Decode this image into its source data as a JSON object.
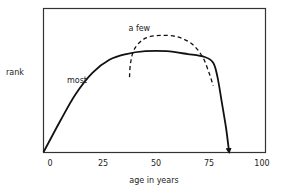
{
  "chart_data": {
    "type": "line",
    "title": "",
    "xlabel": "age in years",
    "ylabel": "rank",
    "xlim": [
      0,
      100
    ],
    "ylim": [
      0,
      1
    ],
    "x_ticks": [
      "0",
      "25",
      "50",
      "75",
      "100"
    ],
    "x_tick_values": [
      0,
      25,
      50,
      75,
      100
    ],
    "grid": false,
    "legend": "none",
    "series": [
      {
        "name": "most",
        "style": "solid",
        "arrow_end": true,
        "points": [
          [
            -3,
            0
          ],
          [
            5,
            0.22
          ],
          [
            12,
            0.4
          ],
          [
            20,
            0.55
          ],
          [
            28,
            0.64
          ],
          [
            36,
            0.68
          ],
          [
            45,
            0.7
          ],
          [
            55,
            0.7
          ],
          [
            65,
            0.68
          ],
          [
            73,
            0.66
          ],
          [
            77,
            0.62
          ],
          [
            79,
            0.52
          ],
          [
            81,
            0.35
          ],
          [
            83,
            0.17
          ],
          [
            84.5,
            0
          ]
        ]
      },
      {
        "name": "a few",
        "style": "dashed",
        "arrow_end": false,
        "points": [
          [
            37.5,
            0.52
          ],
          [
            38,
            0.62
          ],
          [
            40,
            0.72
          ],
          [
            45,
            0.79
          ],
          [
            52,
            0.81
          ],
          [
            60,
            0.8
          ],
          [
            67,
            0.75
          ],
          [
            72,
            0.66
          ],
          [
            75,
            0.55
          ],
          [
            77,
            0.46
          ]
        ]
      }
    ],
    "annotations": [
      {
        "text": "most",
        "x": 8,
        "y": 0.48
      },
      {
        "text": "a few",
        "x": 37,
        "y": 0.84
      }
    ]
  }
}
